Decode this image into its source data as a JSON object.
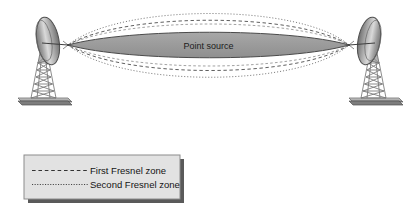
{
  "figure": {
    "center_label": "Point source",
    "colors": {
      "ellipse_fill": "#9e9e9e",
      "ellipse_stroke": "#4a4a4a",
      "fresnel_line": "#6e6e6e",
      "legend_background": "#e2e2e2",
      "legend_border": "#8c8c8c",
      "legend_shadow": "#555555",
      "antenna_dish_dark": "#6b6b6b",
      "antenna_dish_light": "#d6d6d6",
      "tower": "#8f8f8f",
      "background": "#ffffff"
    }
  },
  "antennas": [
    {
      "id": "left-antenna",
      "name": "parabolic-dish-antenna-left"
    },
    {
      "id": "right-antenna",
      "name": "parabolic-dish-antenna-right"
    }
  ],
  "zones": [
    {
      "id": "point-source-zone",
      "name": "point-source-ellipse",
      "style": "solid-filled"
    },
    {
      "id": "first-fresnel-zone",
      "name": "first-fresnel-zone-ellipse",
      "style": "dashed"
    },
    {
      "id": "second-fresnel-zone",
      "name": "second-fresnel-zone-ellipse",
      "style": "dotted"
    }
  ],
  "legend": {
    "items": [
      {
        "label": "First Fresnel zone",
        "line_style": "dashed"
      },
      {
        "label": "Second Fresnel zone",
        "line_style": "dotted"
      }
    ]
  }
}
